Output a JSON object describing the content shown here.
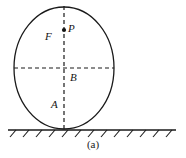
{
  "figure": {
    "caption": "(a)",
    "labels": {
      "focus": "F",
      "point": "P",
      "center": "B",
      "lower": "A"
    },
    "colors": {
      "stroke": "#1a1a1a",
      "dash": "#1a1a1a",
      "ground": "#1a1a1a",
      "background": "#ffffff"
    },
    "geometry": {
      "ellipse_cx": 64,
      "ellipse_cy": 68,
      "ellipse_rx": 50,
      "ellipse_ry": 61,
      "vertical_axis_x": 64,
      "vertical_axis_y1": 6,
      "vertical_axis_y2": 130,
      "horizontal_axis_y": 68,
      "horizontal_axis_x1": 14,
      "horizontal_axis_x2": 114,
      "point_dot_x": 64,
      "point_dot_y": 30,
      "ground_line_y": 130,
      "ground_line_x1": 8,
      "ground_line_x2": 176,
      "hatch_count": 13
    }
  }
}
